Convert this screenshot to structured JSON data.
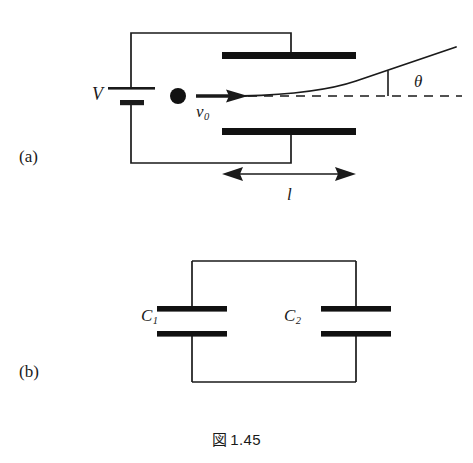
{
  "figure": {
    "caption_kanji": "図",
    "caption_number": "1.45",
    "panels": [
      {
        "key": "a",
        "label": "(a)",
        "title": "charged particle deflected by a parallel-plate capacitor",
        "labels": {
          "voltage": "V",
          "initial_velocity": "v",
          "initial_velocity_subscript": "0",
          "deflection_angle": "θ",
          "plate_length": "l"
        },
        "elements": [
          "battery-symbol",
          "circuit-wire",
          "top-deflection-plate",
          "bottom-deflection-plate",
          "charged-particle",
          "velocity-arrow",
          "trajectory-curve",
          "axis-dashed-line",
          "angle-tick",
          "length-dimension-arrow"
        ]
      },
      {
        "key": "b",
        "label": "(b)",
        "title": "two capacitors connected in parallel",
        "labels": {
          "capacitor_1": "C",
          "capacitor_1_subscript": "1",
          "capacitor_2": "C",
          "capacitor_2_subscript": "2"
        },
        "elements": [
          "circuit-loop-wire",
          "capacitor-c1",
          "capacitor-c2"
        ]
      }
    ],
    "colors": {
      "ink": "#1a1a1a",
      "plate_fill": "#111111",
      "background": "#ffffff"
    }
  }
}
